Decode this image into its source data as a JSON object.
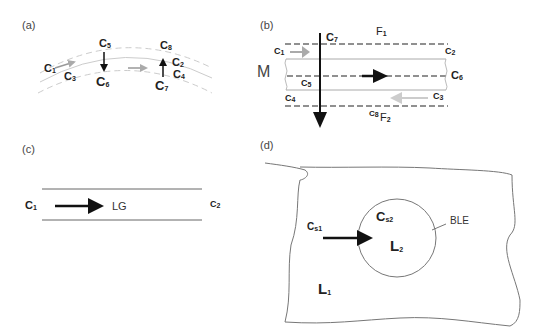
{
  "figure": {
    "panels": [
      {
        "id": "a",
        "label": "(a)",
        "labels": [
          {
            "base": "C",
            "sub": "1"
          },
          {
            "base": "C",
            "sub": "3"
          },
          {
            "base": "C",
            "sub": "5"
          },
          {
            "base": "C",
            "sub": "6"
          },
          {
            "base": "C",
            "sub": "8"
          },
          {
            "base": "C",
            "sub": "2"
          },
          {
            "base": "C",
            "sub": "4"
          },
          {
            "base": "C",
            "sub": "7"
          }
        ]
      },
      {
        "id": "b",
        "label": "(b)",
        "side_label": "M",
        "labels": [
          {
            "base": "F",
            "sub": "1"
          },
          {
            "base": "F",
            "sub": "2"
          },
          {
            "base": "C",
            "sub": "7"
          },
          {
            "base": "C",
            "sub": "1"
          },
          {
            "base": "C",
            "sub": "2"
          },
          {
            "base": "C",
            "sub": "6"
          },
          {
            "base": "C",
            "sub": "5"
          },
          {
            "base": "C",
            "sub": "4"
          },
          {
            "base": "C",
            "sub": "3"
          },
          {
            "base": "C",
            "sub": "8"
          }
        ]
      },
      {
        "id": "c",
        "label": "(c)",
        "flow_label": "LG",
        "labels": [
          {
            "base": "C",
            "sub": "1"
          },
          {
            "base": "C",
            "sub": "2"
          }
        ]
      },
      {
        "id": "d",
        "label": "(d)",
        "boundary_label": "BLE",
        "labels": [
          {
            "base": "C",
            "sub": "s1"
          },
          {
            "base": "C",
            "sub": "s2"
          },
          {
            "base": "L",
            "sub": "2"
          },
          {
            "base": "L",
            "sub": "1"
          }
        ]
      }
    ],
    "colors": {
      "arrow_dark": "#111111",
      "arrow_gray": "#aaaaaa",
      "line_gray": "#999999",
      "dash_light": "#cccccc"
    }
  }
}
